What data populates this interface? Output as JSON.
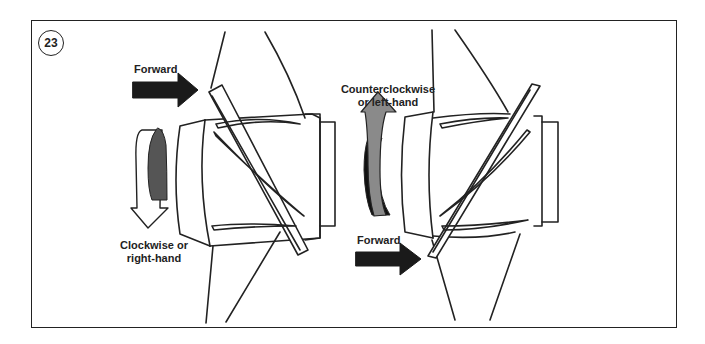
{
  "figure": {
    "number": "23",
    "left_propeller": {
      "forward_label": "Forward",
      "rotation_label_line1": "Clockwise or",
      "rotation_label_line2": "right-hand",
      "rotation": "clockwise"
    },
    "right_propeller": {
      "forward_label": "Forward",
      "rotation_label_line1": "Counterclockwise",
      "rotation_label_line2": "or left-hand",
      "rotation": "counterclockwise"
    },
    "colors": {
      "line": "#222222",
      "arrow_dark": "#1a1a1a",
      "arrow_gray": "#8a8a8a",
      "background": "#ffffff"
    }
  }
}
